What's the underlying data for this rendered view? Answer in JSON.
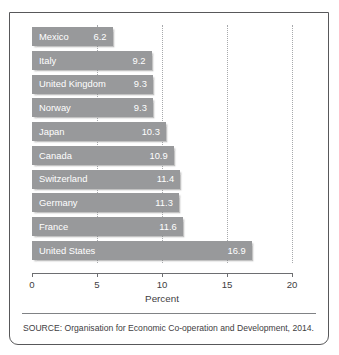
{
  "chart_data": {
    "type": "bar",
    "orientation": "horizontal",
    "title": "",
    "xlabel": "Percent",
    "ylabel": "",
    "xlim": [
      0,
      20
    ],
    "xticks": [
      "0",
      "5",
      "10",
      "15",
      "20"
    ],
    "grid": "vertical-dotted",
    "legend": "none",
    "categories": [
      "Mexico",
      "Italy",
      "United Kingdom",
      "Norway",
      "Japan",
      "Canada",
      "Switzerland",
      "Germany",
      "France",
      "United States"
    ],
    "values": [
      6.2,
      9.2,
      9.3,
      9.3,
      10.3,
      10.9,
      11.4,
      11.3,
      11.6,
      16.9
    ],
    "value_labels": [
      "6.2",
      "9.2",
      "9.3",
      "9.3",
      "10.3",
      "10.9",
      "11.4",
      "11.3",
      "11.6",
      "16.9"
    ],
    "bars": [
      {
        "label": "Mexico",
        "value": 6.2,
        "value_label": "6.2"
      },
      {
        "label": "Italy",
        "value": 9.2,
        "value_label": "9.2"
      },
      {
        "label": "United Kingdom",
        "value": 9.3,
        "value_label": "9.3"
      },
      {
        "label": "Norway",
        "value": 9.3,
        "value_label": "9.3"
      },
      {
        "label": "Japan",
        "value": 10.3,
        "value_label": "10.3"
      },
      {
        "label": "Canada",
        "value": 10.9,
        "value_label": "10.9"
      },
      {
        "label": "Switzerland",
        "value": 11.4,
        "value_label": "11.4"
      },
      {
        "label": "Germany",
        "value": 11.3,
        "value_label": "11.3"
      },
      {
        "label": "France",
        "value": 11.6,
        "value_label": "11.6"
      },
      {
        "label": "United States",
        "value": 16.9,
        "value_label": "16.9"
      }
    ],
    "colors": {
      "bar": "#98999b",
      "bar_text": "#ffffff",
      "axis": "#6d6e71",
      "gridline": "#a7a9ac",
      "text": "#414042",
      "border": "#58585a"
    }
  },
  "source": {
    "text": "SOURCE: Organisation for Economic Co-operation and Development, 2014."
  }
}
